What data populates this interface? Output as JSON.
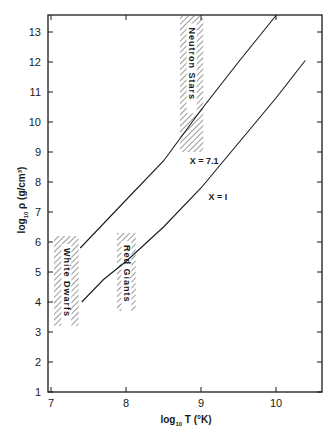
{
  "chart_data": {
    "type": "line",
    "title": "",
    "xlabel": "log10 T (°K)",
    "ylabel": "log10 ρ (g/cm³)",
    "xlim": [
      7,
      10.6
    ],
    "ylim": [
      1,
      13.55
    ],
    "x_ticks": [
      7,
      8,
      9,
      10
    ],
    "y_ticks": [
      1,
      2,
      3,
      4,
      5,
      6,
      7,
      8,
      9,
      10,
      11,
      12,
      13
    ],
    "grid": false,
    "legend": null,
    "series": [
      {
        "name": "X = 7.1",
        "label": "X = 7.1",
        "x": [
          7.39,
          7.6,
          8.0,
          8.5,
          9.0,
          9.5,
          10.0
        ],
        "y": [
          5.8,
          6.35,
          7.4,
          8.7,
          10.4,
          12.0,
          13.55
        ]
      },
      {
        "name": "X = 1",
        "label": "X = I",
        "x": [
          7.41,
          7.7,
          8.0,
          8.5,
          9.0,
          9.5,
          10.0,
          10.39
        ],
        "y": [
          4.0,
          4.75,
          5.35,
          6.5,
          7.8,
          9.3,
          10.8,
          12.05
        ]
      }
    ],
    "regions": [
      {
        "name": "White Dwarfs",
        "x_range": [
          7.04,
          7.37
        ],
        "y_range": [
          3.2,
          6.2
        ]
      },
      {
        "name": "Red Giants",
        "x_range": [
          7.88,
          8.13
        ],
        "y_range": [
          3.7,
          6.3
        ]
      },
      {
        "name": "Neutron Stars",
        "x_range": [
          8.72,
          9.03
        ],
        "y_range": [
          9.0,
          13.55
        ]
      }
    ],
    "annotations": [
      {
        "text": "X = 7.1",
        "x": 8.85,
        "y": 8.6
      },
      {
        "text": "X = I",
        "x": 9.1,
        "y": 7.4
      }
    ]
  },
  "axes": {
    "x_title_prefix": "log",
    "x_title_sub": "10",
    "x_title_suffix": " T (°K)",
    "y_title_prefix": "log",
    "y_title_sub": "10",
    "y_title_suffix": " ρ (g/cm³)",
    "x_tick_labels": [
      "7",
      "8",
      "9",
      "10"
    ],
    "y_tick_labels": [
      "1",
      "2",
      "3",
      "4",
      "5",
      "6",
      "7",
      "8",
      "9",
      "10",
      "11",
      "12",
      "13"
    ]
  },
  "labels": {
    "white_dwarfs": "White Dwarfs",
    "red_giants": "Red Giants",
    "neutron_stars": "Neutron Stars",
    "curve_upper": "X = 7.1",
    "curve_lower": "X = I"
  }
}
